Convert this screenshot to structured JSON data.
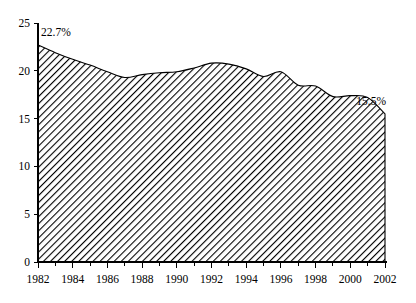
{
  "chart_data": {
    "type": "area",
    "title": "",
    "subtitle": "",
    "xlabel": "",
    "ylabel": "",
    "xlim": [
      1982,
      2002
    ],
    "ylim": [
      0,
      25
    ],
    "grid": false,
    "legend": false,
    "legend_position": "none",
    "x": [
      1982,
      1983,
      1984,
      1985,
      1986,
      1987,
      1988,
      1989,
      1990,
      1991,
      1992,
      1993,
      1994,
      1995,
      1996,
      1997,
      1998,
      1999,
      2000,
      2001,
      2002
    ],
    "values": [
      22.7,
      21.9,
      21.2,
      20.6,
      19.9,
      19.3,
      19.6,
      19.8,
      19.9,
      20.3,
      20.8,
      20.7,
      20.2,
      19.4,
      19.9,
      18.5,
      18.4,
      17.3,
      17.4,
      17.2,
      15.5
    ],
    "x_tick_labels": [
      "1982",
      "1984",
      "1986",
      "1988",
      "1990",
      "1992",
      "1994",
      "1996",
      "1998",
      "2000",
      "2002"
    ],
    "x_tick_values": [
      1982,
      1984,
      1986,
      1988,
      1990,
      1992,
      1994,
      1996,
      1998,
      2000,
      2002
    ],
    "x_minor_ticks": [
      1983,
      1985,
      1987,
      1989,
      1991,
      1993,
      1995,
      1997,
      1999,
      2001
    ],
    "y_tick_labels": [
      "0",
      "5",
      "10",
      "15",
      "20",
      "25"
    ],
    "y_tick_values": [
      0,
      5,
      10,
      15,
      20,
      25
    ],
    "annotations": [
      {
        "name": "start-value-label",
        "text": "22.7%",
        "x": 1982,
        "y": 22.7
      },
      {
        "name": "end-value-label",
        "text": "15.5%",
        "x": 2002,
        "y": 15.5
      }
    ],
    "series_fill": "diagonal-hatch",
    "colors": {
      "line": "#000000",
      "hatch": "#000000",
      "background": "#ffffff",
      "axis": "#000000"
    }
  },
  "labels": {
    "y": [
      "0",
      "5",
      "10",
      "15",
      "20",
      "25"
    ],
    "x": [
      "1982",
      "1984",
      "1986",
      "1988",
      "1990",
      "1992",
      "1994",
      "1996",
      "1998",
      "2000",
      "2002"
    ],
    "start_annotation": "22.7%",
    "end_annotation": "15.5%"
  }
}
